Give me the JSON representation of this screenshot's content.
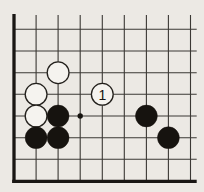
{
  "diagram": {
    "type": "go-board-corner",
    "colors": {
      "paper": "#ece9e4",
      "line": "#3b3834",
      "edge": "#191613",
      "black_stone": "#16130f",
      "white_stone_fill": "#f5f3ef",
      "stone_outline": "#23201c",
      "label_color": "#161310"
    },
    "grid": {
      "col_xs": [
        14,
        36.1,
        58.1,
        80.2,
        102.3,
        124.3,
        146.4,
        168.4,
        190.5
      ],
      "row_ys": [
        29.3,
        51.0,
        72.7,
        94.3,
        116.0,
        137.7,
        159.3,
        181.3
      ],
      "top_cut_y": 15,
      "right_end_x": 196.7,
      "left_edge_overhang": 1.8,
      "thin_width": 1.1,
      "thick_width": 3.3
    },
    "stone_radius": 10.9,
    "label_font_size": 14,
    "stones": [
      {
        "color": "white",
        "col": 2,
        "row": 2,
        "label": ""
      },
      {
        "color": "white",
        "col": 1,
        "row": 3,
        "label": ""
      },
      {
        "color": "white",
        "col": 1,
        "row": 4,
        "label": ""
      },
      {
        "color": "white",
        "col": 4,
        "row": 3,
        "label": "1"
      },
      {
        "color": "black",
        "col": 2,
        "row": 4,
        "label": ""
      },
      {
        "color": "black",
        "col": 1,
        "row": 5,
        "label": ""
      },
      {
        "color": "black",
        "col": 2,
        "row": 5,
        "label": ""
      },
      {
        "color": "black",
        "col": 6,
        "row": 4,
        "label": ""
      },
      {
        "color": "black",
        "col": 7,
        "row": 5,
        "label": ""
      }
    ],
    "markers": [
      {
        "type": "dot",
        "col": 3,
        "row": 4,
        "radius": 2.7
      }
    ]
  }
}
